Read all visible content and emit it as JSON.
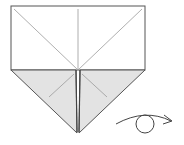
{
  "diagram": {
    "instruction": "turn over",
    "colors": {
      "paper_front": "#ffffff",
      "paper_back": "#e3e3e3",
      "outline": "#555555",
      "crease": "#9a9a9a",
      "arrow": "#444444"
    },
    "symbols": [
      {
        "name": "turn-over-symbol",
        "meaning": "turn the model over"
      }
    ]
  }
}
